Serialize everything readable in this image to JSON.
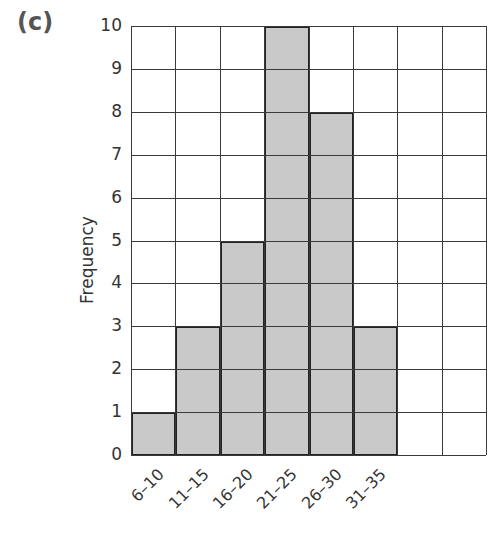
{
  "part_label": "(c)",
  "chart_data": {
    "type": "bar",
    "title": "",
    "xlabel": "",
    "ylabel": "Frequency",
    "categories": [
      "6–10",
      "11–15",
      "16–20",
      "21–25",
      "26–30",
      "31–35"
    ],
    "values": [
      1,
      3,
      5,
      10,
      8,
      3
    ],
    "ylim": [
      0,
      10
    ],
    "yticks": [
      0,
      1,
      2,
      3,
      4,
      5,
      6,
      7,
      8,
      9,
      10
    ],
    "grid": true,
    "grid_columns": 8,
    "legend": null,
    "bar_color": "#c9c9c9",
    "bar_edge_color": "#222222"
  }
}
